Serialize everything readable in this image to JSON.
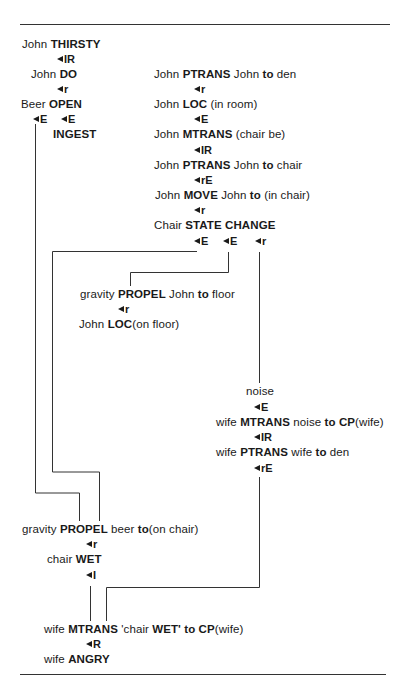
{
  "diagram": {
    "nodes": {
      "john_thirsty": {
        "pre": "John ",
        "act": "THIRSTY"
      },
      "john_do": {
        "pre": "John ",
        "act": "DO"
      },
      "beer_open": {
        "pre": "Beer ",
        "act": "OPEN"
      },
      "ingest": {
        "act": "INGEST"
      },
      "ptrans_den": {
        "pre": "John ",
        "act": "PTRANS",
        "mid": " John ",
        "to": "to",
        "post": " den"
      },
      "loc_room": {
        "pre": "John ",
        "act": "LOC",
        "post": " (in room)"
      },
      "mtrans_chair": {
        "pre": "John ",
        "act": "MTRANS",
        "post": " (chair be)"
      },
      "ptrans_chair": {
        "pre": "John ",
        "act": "PTRANS",
        "mid": " John ",
        "to": "to",
        "post": " chair"
      },
      "move_chair": {
        "pre": "John ",
        "act": "MOVE",
        "mid": " John ",
        "to": "to",
        "post": " (in chair)"
      },
      "state_change": {
        "pre": "Chair ",
        "act": "STATE CHANGE"
      },
      "propel_john": {
        "pre": "gravity ",
        "act": "PROPEL",
        "mid": " John ",
        "to": "to",
        "post": " floor"
      },
      "loc_floor": {
        "pre": "John ",
        "act": "LOC",
        "post": "(on floor)"
      },
      "noise": {
        "pre": "noise"
      },
      "wife_mtrans_noise": {
        "pre": "wife ",
        "act": "MTRANS",
        "mid": " noise ",
        "to": "to CP",
        "post": "(wife)"
      },
      "wife_ptrans": {
        "pre": "wife ",
        "act": "PTRANS",
        "mid": " wife ",
        "to": "to",
        "post": " den"
      },
      "propel_beer": {
        "pre": "gravity ",
        "act": "PROPEL",
        "mid": " beer ",
        "to": "to",
        "post": "(on chair)"
      },
      "chair_wet": {
        "pre": "chair ",
        "act": "WET"
      },
      "wife_mtrans_wet": {
        "pre": "wife ",
        "act": "MTRANS",
        "mid": " 'chair ",
        "act2": "WET'",
        "to": " to CP",
        "post": "(wife)"
      },
      "wife_angry": {
        "pre": "wife ",
        "act": "ANGRY"
      }
    },
    "links": {
      "thirsty_do": "IR",
      "do_open": "r",
      "open_e1": "E",
      "open_e2": "E",
      "den_loc": "r",
      "loc_mtrans": "E",
      "mtrans_ptrans": "IR",
      "ptrans_move": "rE",
      "move_state": "r",
      "state_e1": "E",
      "state_e2": "E",
      "state_r": "r",
      "propel_loc": "r",
      "noise_mtrans": "E",
      "mtrans_ptrans_wife": "IR",
      "wife_ptrans_out": "rE",
      "propel_wet": "r",
      "wet_i": "I",
      "mtrans_angry": "R"
    }
  }
}
